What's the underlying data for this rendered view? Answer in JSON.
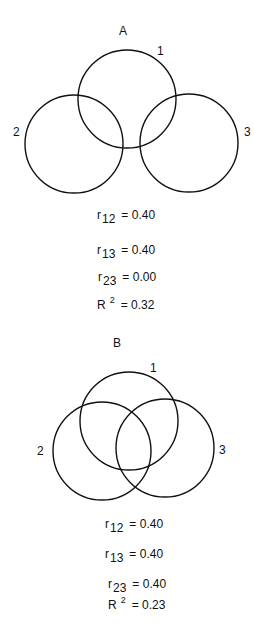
{
  "panels": [
    {
      "id": "A",
      "title": "A",
      "circles": [
        {
          "label": "1",
          "cx": 127,
          "cy": 99,
          "r": 49
        },
        {
          "label": "2",
          "cx": 74,
          "cy": 144,
          "r": 49
        },
        {
          "label": "3",
          "cx": 189,
          "cy": 143,
          "r": 49
        }
      ],
      "stats": [
        {
          "symbol": "r",
          "sub": "12",
          "value": "= 0.40"
        },
        {
          "symbol": "r",
          "sub": "13",
          "value": "= 0.40"
        },
        {
          "symbol": "r",
          "sub": "23",
          "value": "= 0.00"
        },
        {
          "symbol": "R",
          "sup": "2",
          "value": "= 0.32"
        }
      ]
    },
    {
      "id": "B",
      "title": "B",
      "circles": [
        {
          "label": "1",
          "cx": 129,
          "cy": 421,
          "r": 49
        },
        {
          "label": "2",
          "cx": 102,
          "cy": 451,
          "r": 49
        },
        {
          "label": "3",
          "cx": 165,
          "cy": 448,
          "r": 49
        }
      ],
      "stats": [
        {
          "symbol": "r",
          "sub": "12",
          "value": "= 0.40"
        },
        {
          "symbol": "r",
          "sub": "13",
          "value": "= 0.40"
        },
        {
          "symbol": "r",
          "sub": "23",
          "value": "= 0.40"
        },
        {
          "symbol": "R",
          "sup": "2",
          "value": "= 0.23"
        }
      ]
    }
  ]
}
